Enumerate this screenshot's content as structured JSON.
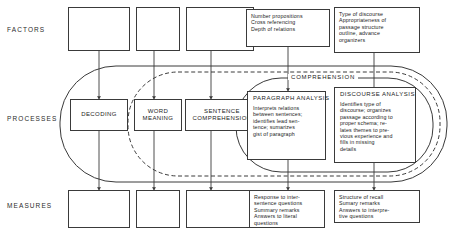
{
  "diagram": {
    "tier_labels": [
      {
        "id": "factors",
        "text": "FACTORS"
      },
      {
        "id": "processes",
        "text": "PROCESSES"
      },
      {
        "id": "measures",
        "text": "MEASURES"
      }
    ],
    "oval_labels": {
      "comprehension": "COMPREHENSION"
    },
    "factor_boxes": [
      {
        "id": "factor-1",
        "text": ""
      },
      {
        "id": "factor-2",
        "text": ""
      },
      {
        "id": "factor-3",
        "text": ""
      },
      {
        "id": "factor-4",
        "text": "Number propositions\nCross referencing\nDepth of relations"
      },
      {
        "id": "factor-5",
        "text": "Type of discourse\nAppropriateness of\npassage structure\noutline, advance\norganizers"
      }
    ],
    "process_boxes": [
      {
        "id": "decoding",
        "text": "DECODING"
      },
      {
        "id": "word-meaning",
        "text": "WORD\nMEANING"
      },
      {
        "id": "sentence-comprehension",
        "text": "SENTENCE\nCOMPREHENSION"
      }
    ],
    "analysis_boxes": [
      {
        "id": "paragraph-analysis",
        "title": "PARAGRAPH ANALYSIS",
        "body": "Interprets relations\nbetween sentences;\nidentifies lead sen-\ntence; sumarizes\ngist of paragraph"
      },
      {
        "id": "discourse-analysis",
        "title": "DISCOURSE ANALYSIS",
        "body": "Identifies type of\ndiscourse; organizes\npassage according to\nproper schema; re-\nlates themes to pre-\nvious experience and\nfills in missing\ndetails"
      }
    ],
    "measure_boxes": [
      {
        "id": "measure-1",
        "text": ""
      },
      {
        "id": "measure-2",
        "text": ""
      },
      {
        "id": "measure-3",
        "text": ""
      },
      {
        "id": "measure-4",
        "text": "Response to inter-\nsentence questions\nSummary remarks\nAnswers to literal\nquestions"
      },
      {
        "id": "measure-5",
        "text": "Structure of recall\nSumary remarks\nAnswers to interpre-\ntive questions"
      }
    ],
    "colors": {
      "stroke": "#3a3a3a",
      "text": "#1b1b1b",
      "background": "#ffffff"
    }
  }
}
